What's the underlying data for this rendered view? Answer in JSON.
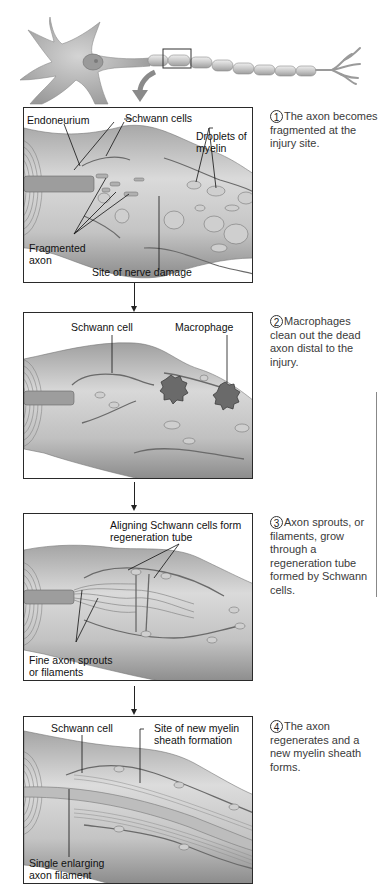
{
  "overview": {
    "description": "Neuron with myelinated axon; boxed region on axon is magnified below",
    "highlight_box": "magnified-region"
  },
  "steps": [
    {
      "number": "1",
      "caption": "The axon becomes fragmented at the injury site.",
      "labels": {
        "endoneurium": "Endoneurium",
        "schwann_cells": "Schwann cells",
        "droplets_line1": "Droplets of",
        "droplets_line2": "myelin",
        "fragmented_line1": "Fragmented",
        "fragmented_line2": "axon",
        "site": "Site of nerve damage"
      }
    },
    {
      "number": "2",
      "caption": "Macrophages clean out the dead axon distal to the injury.",
      "labels": {
        "schwann_cell": "Schwann cell",
        "macrophage": "Macrophage"
      }
    },
    {
      "number": "3",
      "caption": "Axon sprouts, or filaments, grow through a regeneration tube formed by Schwann cells.",
      "labels": {
        "aligning_line1": "Aligning Schwann cells form",
        "aligning_line2": "regeneration tube",
        "sprouts_line1": "Fine axon sprouts",
        "sprouts_line2": "or filaments"
      }
    },
    {
      "number": "4",
      "caption": "The axon regenerates and a new myelin sheath forms.",
      "labels": {
        "schwann_cell": "Schwann cell",
        "site_line1": "Site of new myelin",
        "site_line2": "sheath formation",
        "single_line1": "Single enlarging",
        "single_line2": "axon filament"
      }
    }
  ],
  "colors": {
    "tissue_light": "#d9d9d9",
    "tissue_mid": "#b5b5b5",
    "tissue_dark": "#7a7a7a",
    "border": "#2a2a2a",
    "caption_text": "#3a3a3a"
  }
}
